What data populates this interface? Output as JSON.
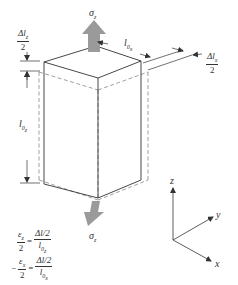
{
  "diagram": {
    "type": "cube-strain-illustration",
    "stress_labels": {
      "top": "σz",
      "bottom": "σz"
    },
    "dimension_labels": {
      "top_left_delta_num": "Δlz",
      "top_left_delta_den": "2",
      "height": "l0z",
      "width_top": "l0x",
      "right_delta_num": "Δlx",
      "right_delta_den": "2"
    },
    "equations": [
      {
        "lhs_num": "εz",
        "lhs_den": "2",
        "op": "=",
        "rhs_num": "Δlz/2",
        "rhs_den": "l0z",
        "prefix": ""
      },
      {
        "lhs_num": "εx",
        "lhs_den": "2",
        "op": "=",
        "rhs_num": "Δlx/2",
        "rhs_den": "l0x",
        "prefix": "−"
      }
    ],
    "axes": {
      "z": "z",
      "y": "y",
      "x": "x"
    },
    "colors": {
      "arrow_fill": "#9a9a9a",
      "line": "#333333",
      "dashed": "#777777"
    }
  }
}
